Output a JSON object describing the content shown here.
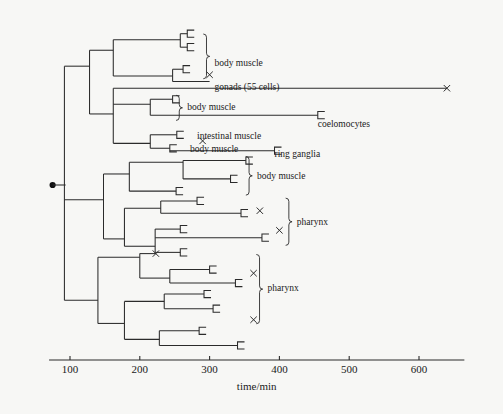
{
  "figure": {
    "title_visible": false,
    "background_color": "#f7f7f5",
    "line_color": "#2b2b2b"
  },
  "chart_data": {
    "type": "tree",
    "title": "",
    "xlabel": "time/min",
    "ylabel": "",
    "xlim": [
      60,
      660
    ],
    "grid": false,
    "legend": null,
    "axis": {
      "label": "time/min",
      "ticks": [
        100,
        200,
        300,
        400,
        500,
        600
      ],
      "tick_labels": [
        "100",
        "200",
        "300",
        "400",
        "500",
        "600"
      ],
      "start_value": 70,
      "end_value": 665
    },
    "root": {
      "time": 88,
      "marker": "filled-circle"
    },
    "annotations": [
      {
        "text": "body muscle",
        "time": 307,
        "row": 2.0,
        "brace": {
          "from_row": 0,
          "to_row": 3
        }
      },
      {
        "text": "gonads (55 cells)",
        "time": 307,
        "row": 4,
        "brace": null
      },
      {
        "text": "body  muscle",
        "time": 268,
        "row": 5.6,
        "brace": {
          "from_row": 5,
          "to_row": 6.4
        }
      },
      {
        "text": "coelomocytes",
        "time": 455,
        "row": 7,
        "brace": null
      },
      {
        "text": "intestinal  muscle",
        "time": 282,
        "row": 8,
        "brace": null
      },
      {
        "text": "body  muscle",
        "time": 272,
        "row": 9,
        "brace": null
      },
      {
        "text": "ring ganglia",
        "time": 393,
        "row": 9.4,
        "brace": null
      },
      {
        "text": "body  muscle",
        "time": 368,
        "row": 11.2,
        "brace": {
          "from_row": 10,
          "to_row": 12.5
        }
      },
      {
        "text": "pharynx",
        "time": 425,
        "row": 15.0,
        "brace": {
          "from_row": 13.4,
          "to_row": 16.6
        }
      },
      {
        "text": "pharynx",
        "time": 383,
        "row": 20.4,
        "brace": {
          "from_row": 18,
          "to_row": 23
        }
      }
    ],
    "terminal_markers": [
      {
        "time": 300,
        "row": 3,
        "marker": "x"
      },
      {
        "time": 640,
        "row": 4.1,
        "marker": "x"
      },
      {
        "time": 290,
        "row": 8.4,
        "marker": "x"
      },
      {
        "time": 372,
        "row": 14.1,
        "marker": "x"
      },
      {
        "time": 400,
        "row": 15.7,
        "marker": "x"
      },
      {
        "time": 223,
        "row": 17.6,
        "marker": "x"
      },
      {
        "time": 363,
        "row": 19.2,
        "marker": "x"
      },
      {
        "time": 363,
        "row": 23.0,
        "marker": "x"
      }
    ],
    "branches": [
      {
        "type": "h",
        "time_from": 88,
        "time_to": 88,
        "row": 12.0
      },
      {
        "type": "v",
        "time": 92,
        "row_from": 2.3,
        "row_to": 21.4
      },
      {
        "type": "h",
        "time_from": 92,
        "time_to": 128,
        "row": 2.3
      },
      {
        "type": "v",
        "time": 128,
        "row_from": 1.0,
        "row_to": 6.2
      },
      {
        "type": "h",
        "time_from": 128,
        "time_to": 162,
        "row": 1.0
      },
      {
        "type": "v",
        "time": 162,
        "row_from": 0.15,
        "row_to": 3.1
      },
      {
        "type": "h",
        "time_from": 162,
        "time_to": 258,
        "row": 0.15
      },
      {
        "type": "v",
        "time": 258,
        "row_from": -0.35,
        "row_to": 0.75
      },
      {
        "type": "h",
        "time_from": 258,
        "time_to": 268,
        "row": -0.35
      },
      {
        "type": "h",
        "time_from": 258,
        "time_to": 268,
        "row": 0.75
      },
      {
        "type": "h",
        "time_from": 162,
        "time_to": 247,
        "row": 3.1
      },
      {
        "type": "v",
        "time": 247,
        "row_from": 2.55,
        "row_to": 3.55
      },
      {
        "type": "h",
        "time_from": 247,
        "time_to": 262,
        "row": 2.55
      },
      {
        "type": "h",
        "time_from": 247,
        "time_to": 300,
        "row": 3.55
      },
      {
        "type": "h",
        "time_from": 128,
        "time_to": 162,
        "row": 6.2
      },
      {
        "type": "v",
        "time": 162,
        "row_from": 4.1,
        "row_to": 8.6
      },
      {
        "type": "h",
        "time_from": 162,
        "time_to": 640,
        "row": 4.1
      },
      {
        "type": "h",
        "time_from": 162,
        "time_to": 215,
        "row": 5.4
      },
      {
        "type": "v",
        "time": 215,
        "row_from": 5.0,
        "row_to": 6.3
      },
      {
        "type": "h",
        "time_from": 215,
        "time_to": 247,
        "row": 5.0
      },
      {
        "type": "h",
        "time_from": 215,
        "time_to": 455,
        "row": 6.3
      },
      {
        "type": "v",
        "time": 162,
        "row_from": 5.4,
        "row_to": 5.4
      },
      {
        "type": "h",
        "time_from": 162,
        "time_to": 215,
        "row": 8.6
      },
      {
        "type": "v",
        "time": 215,
        "row_from": 7.9,
        "row_to": 9.0
      },
      {
        "type": "h",
        "time_from": 215,
        "time_to": 253,
        "row": 7.9
      },
      {
        "type": "h",
        "time_from": 215,
        "time_to": 243,
        "row": 9.0
      },
      {
        "type": "h",
        "time_from": 243,
        "time_to": 393,
        "row": 9.2
      },
      {
        "type": "h",
        "time_from": 92,
        "time_to": 148,
        "row": 13.2
      },
      {
        "type": "v",
        "time": 148,
        "row_from": 11.1,
        "row_to": 16.4
      },
      {
        "type": "h",
        "time_from": 148,
        "time_to": 185,
        "row": 11.1
      },
      {
        "type": "v",
        "time": 185,
        "row_from": 10.15,
        "row_to": 12.5
      },
      {
        "type": "h",
        "time_from": 185,
        "time_to": 262,
        "row": 10.15
      },
      {
        "type": "v",
        "time": 262,
        "row_from": 10.0,
        "row_to": 11.5
      },
      {
        "type": "h",
        "time_from": 262,
        "time_to": 352,
        "row": 10.0
      },
      {
        "type": "h",
        "time_from": 262,
        "time_to": 330,
        "row": 11.5
      },
      {
        "type": "h",
        "time_from": 185,
        "time_to": 252,
        "row": 12.5
      },
      {
        "type": "h",
        "time_from": 148,
        "time_to": 178,
        "row": 16.4
      },
      {
        "type": "v",
        "time": 178,
        "row_from": 13.9,
        "row_to": 17.0
      },
      {
        "type": "h",
        "time_from": 178,
        "time_to": 230,
        "row": 13.9
      },
      {
        "type": "v",
        "time": 230,
        "row_from": 13.3,
        "row_to": 14.3
      },
      {
        "type": "h",
        "time_from": 230,
        "time_to": 282,
        "row": 13.3
      },
      {
        "type": "h",
        "time_from": 230,
        "time_to": 345,
        "row": 14.3
      },
      {
        "type": "h",
        "time_from": 178,
        "time_to": 222,
        "row": 17.0
      },
      {
        "type": "v",
        "time": 222,
        "row_from": 15.6,
        "row_to": 17.5
      },
      {
        "type": "h",
        "time_from": 222,
        "time_to": 258,
        "row": 15.6
      },
      {
        "type": "h",
        "time_from": 222,
        "time_to": 375,
        "row": 16.3
      },
      {
        "type": "h",
        "time_from": 222,
        "time_to": 258,
        "row": 17.5
      },
      {
        "type": "v",
        "time": 222,
        "row_from": 16.3,
        "row_to": 16.3
      },
      {
        "type": "h",
        "time_from": 92,
        "time_to": 140,
        "row": 21.4
      },
      {
        "type": "v",
        "time": 140,
        "row_from": 17.9,
        "row_to": 23.3
      },
      {
        "type": "h",
        "time_from": 140,
        "time_to": 200,
        "row": 17.9
      },
      {
        "type": "v",
        "time": 200,
        "row_from": 17.6,
        "row_to": 19.6
      },
      {
        "type": "h",
        "time_from": 200,
        "time_to": 223,
        "row": 17.6
      },
      {
        "type": "h",
        "time_from": 200,
        "time_to": 243,
        "row": 19.6
      },
      {
        "type": "v",
        "time": 243,
        "row_from": 18.9,
        "row_to": 20.0
      },
      {
        "type": "h",
        "time_from": 243,
        "time_to": 300,
        "row": 18.9
      },
      {
        "type": "h",
        "time_from": 243,
        "time_to": 337,
        "row": 20.0
      },
      {
        "type": "h",
        "time_from": 140,
        "time_to": 178,
        "row": 23.3
      },
      {
        "type": "v",
        "time": 178,
        "row_from": 21.5,
        "row_to": 24.6
      },
      {
        "type": "h",
        "time_from": 178,
        "time_to": 235,
        "row": 21.5
      },
      {
        "type": "v",
        "time": 235,
        "row_from": 20.9,
        "row_to": 22.1
      },
      {
        "type": "h",
        "time_from": 235,
        "time_to": 292,
        "row": 20.9
      },
      {
        "type": "h",
        "time_from": 235,
        "time_to": 305,
        "row": 22.1
      },
      {
        "type": "h",
        "time_from": 178,
        "time_to": 228,
        "row": 24.6
      },
      {
        "type": "v",
        "time": 228,
        "row_from": 23.9,
        "row_to": 25.1
      },
      {
        "type": "h",
        "time_from": 228,
        "time_to": 285,
        "row": 23.9
      },
      {
        "type": "h",
        "time_from": 228,
        "time_to": 340,
        "row": 25.1
      }
    ],
    "terminal_brackets": [
      {
        "time": 268,
        "row": -0.35
      },
      {
        "time": 268,
        "row": 0.75
      },
      {
        "time": 262,
        "row": 2.55
      },
      {
        "time": 247,
        "row": 5.0
      },
      {
        "time": 455,
        "row": 6.3
      },
      {
        "time": 253,
        "row": 7.9
      },
      {
        "time": 243,
        "row": 9.0
      },
      {
        "time": 393,
        "row": 9.2
      },
      {
        "time": 352,
        "row": 10.0
      },
      {
        "time": 330,
        "row": 11.5
      },
      {
        "time": 252,
        "row": 12.5
      },
      {
        "time": 282,
        "row": 13.3
      },
      {
        "time": 345,
        "row": 14.3
      },
      {
        "time": 258,
        "row": 15.6
      },
      {
        "time": 375,
        "row": 16.3
      },
      {
        "time": 258,
        "row": 17.5
      },
      {
        "time": 300,
        "row": 18.9
      },
      {
        "time": 337,
        "row": 20.0
      },
      {
        "time": 292,
        "row": 20.9
      },
      {
        "time": 305,
        "row": 22.1
      },
      {
        "time": 285,
        "row": 23.9
      },
      {
        "time": 340,
        "row": 25.1
      }
    ]
  }
}
